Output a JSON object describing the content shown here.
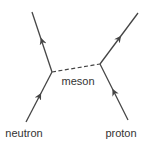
{
  "diagram": {
    "type": "feynman-diagram",
    "colors": {
      "line": "#444444",
      "text": "#333333",
      "background": "#ffffff"
    },
    "vertices": [
      {
        "id": "v_left",
        "x": 52,
        "y": 72
      },
      {
        "id": "v_right",
        "x": 100,
        "y": 64
      }
    ],
    "particles": [
      {
        "id": "neutron_in",
        "label": "neutron",
        "from": [
          26,
          122
        ],
        "to": [
          52,
          72
        ],
        "arrow": "forward",
        "style": "solid"
      },
      {
        "id": "neutron_out",
        "label": "",
        "from": [
          52,
          72
        ],
        "to": [
          32,
          12
        ],
        "arrow": "forward",
        "style": "solid"
      },
      {
        "id": "proton_in",
        "label": "proton",
        "from": [
          128,
          120
        ],
        "to": [
          100,
          64
        ],
        "arrow": "forward",
        "style": "solid"
      },
      {
        "id": "proton_out",
        "label": "",
        "from": [
          100,
          64
        ],
        "to": [
          138,
          13
        ],
        "arrow": "forward",
        "style": "solid"
      },
      {
        "id": "meson",
        "label": "meson",
        "from": [
          52,
          72
        ],
        "to": [
          100,
          64
        ],
        "arrow": "none",
        "style": "dashed"
      }
    ],
    "labels": {
      "meson": "meson",
      "neutron": "neutron",
      "proton": "proton"
    }
  }
}
